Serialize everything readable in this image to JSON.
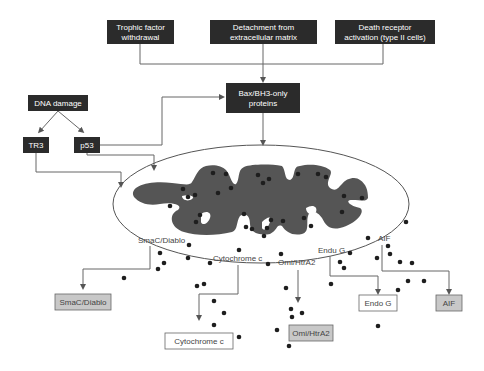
{
  "colors": {
    "dark_box": "#2b2b2b",
    "dark_text": "#ffffff",
    "mito_fill": "#555555",
    "line": "#555555",
    "dot": "#1e1e1e",
    "grey_box": "#c8c8c8",
    "white_box": "#ffffff",
    "label_text": "#444444"
  },
  "triggers": [
    {
      "line1": "Trophic factor",
      "line2": "withdrawal"
    },
    {
      "line1": "Detachment from",
      "line2": "extracellular matrix"
    },
    {
      "line1": "Death receptor",
      "line2": "activation (type II cells)"
    }
  ],
  "dna_damage": {
    "label": "DNA damage"
  },
  "tr3": {
    "label": "TR3"
  },
  "p53": {
    "label": "p53"
  },
  "bax": {
    "line1": "Bax/BH3-only",
    "line2": "proteins"
  },
  "mito_labels": {
    "smac": "SmaC/Diablo",
    "cytochrome": "Cytochrome c",
    "omi": "Omi/HtrA2",
    "endog": "Endu G",
    "aif": "AIF"
  },
  "released": {
    "smac": "SmaC/Diablo",
    "cytochrome": "Cytochrome c",
    "omi": "Omi/HtrA2",
    "endog": "Endo G",
    "aif": "AIF"
  }
}
